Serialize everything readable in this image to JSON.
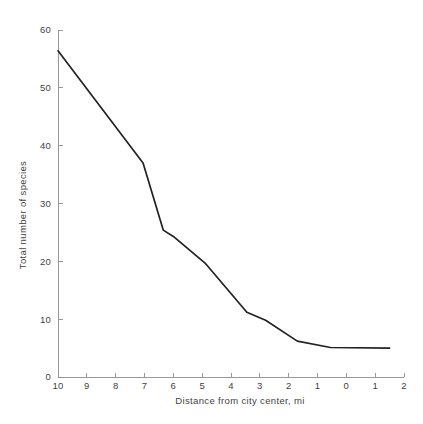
{
  "chart_data": {
    "type": "line",
    "title": "",
    "xlabel": "Distance from city center, mi",
    "ylabel": "Total number of species",
    "xticklabels": [
      "10",
      "9",
      "8",
      "7",
      "6",
      "5",
      "4",
      "3",
      "2",
      "1",
      "0",
      "1",
      "2"
    ],
    "yticklabels": [
      "0",
      "10",
      "20",
      "30",
      "40",
      "50",
      "60"
    ],
    "ylim": [
      0,
      60
    ],
    "grid": false,
    "legend": null,
    "series": [
      {
        "name": "Total number of species",
        "color": "#222222",
        "points": [
          {
            "x_index": 0.0,
            "x_label": "10",
            "y": 56.4
          },
          {
            "x_index": 2.95,
            "x_label": "7",
            "y": 37.0
          },
          {
            "x_index": 3.65,
            "x_label": "6.3",
            "y": 25.4
          },
          {
            "x_index": 4.0,
            "x_label": "6",
            "y": 24.3
          },
          {
            "x_index": 5.1,
            "x_label": "4.9",
            "y": 19.7
          },
          {
            "x_index": 6.55,
            "x_label": "3.5",
            "y": 11.2
          },
          {
            "x_index": 7.2,
            "x_label": "2.8",
            "y": 9.8
          },
          {
            "x_index": 8.3,
            "x_label": "1.7",
            "y": 6.2
          },
          {
            "x_index": 9.45,
            "x_label": "0.5",
            "y": 5.1
          },
          {
            "x_index": 11.5,
            "x_label": "1.5",
            "y": 5.0
          }
        ]
      }
    ]
  }
}
